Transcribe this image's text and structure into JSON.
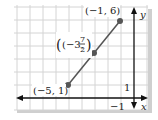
{
  "figure": {
    "type": "coordinate-plane",
    "grid_unit_px": 13,
    "colors": {
      "grid": "#d4d4d4",
      "axis": "#111111",
      "line": "#555555",
      "point": "#555555",
      "shadow": "#cfcfcf",
      "panel": "#ffffff"
    }
  },
  "axes": {
    "x_label": "x",
    "y_label": "y",
    "x_tick_label": "−1",
    "y_tick_label": "1"
  },
  "points": [
    {
      "label": "(−5, 1)",
      "x": -5,
      "y": 1
    },
    {
      "label_prefix": "(−3, ",
      "label_num": "7",
      "label_den": "2",
      "label_suffix": ")",
      "x": -3,
      "y": 3.5
    },
    {
      "label": "(−1, 6)",
      "x": -1,
      "y": 6
    }
  ],
  "segment": {
    "from": [
      -5,
      1
    ],
    "to": [
      -1,
      6
    ]
  }
}
